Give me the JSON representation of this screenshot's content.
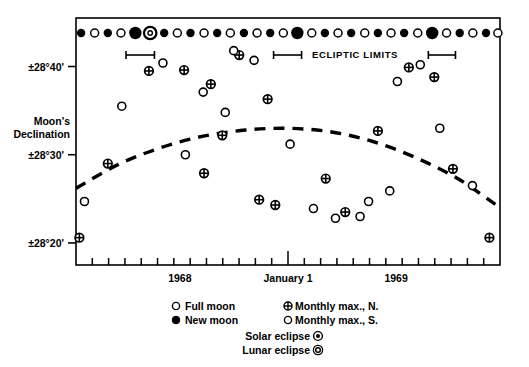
{
  "figure": {
    "background_color": "#ffffff",
    "ink_color": "#000000"
  },
  "axes": {
    "y_axis_title_line1": "Moon's",
    "y_axis_title_line2": "Declination",
    "y_ticks": [
      {
        "label": "±28°40'",
        "value": 2840
      },
      {
        "label": "±28°30'",
        "value": 2830
      },
      {
        "label": "±28°20'",
        "value": 2820
      }
    ],
    "x_tick_labels": [
      {
        "label": "1968",
        "x_fraction": 0.245
      },
      {
        "label": "January 1",
        "x_fraction": 0.5
      },
      {
        "label": "1969",
        "x_fraction": 0.755
      }
    ],
    "x_minor_tick_count": 26,
    "grid": false,
    "ylim": [
      2817.5,
      2845.5
    ],
    "xlim": [
      0,
      1
    ]
  },
  "annotations": {
    "ecliptic_limits_label": "ECLIPTIC LIMITS",
    "ecliptic_limit_brackets": [
      {
        "x_start": 0.118,
        "x_end": 0.185
      },
      {
        "x_start": 0.466,
        "x_end": 0.532
      },
      {
        "x_start": 0.831,
        "x_end": 0.895
      }
    ]
  },
  "legend": {
    "items": [
      {
        "symbol": "open-circle",
        "label": "Full moon"
      },
      {
        "symbol": "filled-circle",
        "label": "New moon"
      },
      {
        "symbol": "crossed-circle",
        "label": "Monthly max., N."
      },
      {
        "symbol": "open-circle",
        "label": "Monthly max., S."
      },
      {
        "symbol": "dot-in-circle",
        "label": "Solar eclipse"
      },
      {
        "symbol": "double-ring-circle",
        "label": "Lunar eclipse"
      }
    ],
    "solar_eclipse_label": "Solar eclipse",
    "lunar_eclipse_label": "Lunar eclipse"
  },
  "chart_data": {
    "type": "scatter",
    "title": "",
    "xlabel": "",
    "ylabel": "Moon's Declination",
    "ylim": [
      2817.5,
      2845.5
    ],
    "y_tick_values": [
      2840,
      2830,
      2820
    ],
    "y_tick_labels": [
      "±28°40'",
      "±28°30'",
      "±28°20'"
    ],
    "x_tick_labels": [
      "1968",
      "January 1",
      "1969"
    ],
    "grid": false,
    "legend_position": "below-axes",
    "series": [
      {
        "name": "Monthly max., N.",
        "symbol": "crossed-circle",
        "points": [
          {
            "x": 0.008,
            "y": 2820.6
          },
          {
            "x": 0.075,
            "y": 2829.0
          },
          {
            "x": 0.172,
            "y": 2839.5
          },
          {
            "x": 0.255,
            "y": 2839.6
          },
          {
            "x": 0.345,
            "y": 2832.2
          },
          {
            "x": 0.432,
            "y": 2824.9
          },
          {
            "x": 0.47,
            "y": 2824.3
          },
          {
            "x": 0.385,
            "y": 2841.3
          },
          {
            "x": 0.318,
            "y": 2838.0
          },
          {
            "x": 0.452,
            "y": 2836.3
          },
          {
            "x": 0.302,
            "y": 2827.9
          },
          {
            "x": 0.589,
            "y": 2827.3
          },
          {
            "x": 0.635,
            "y": 2823.5
          },
          {
            "x": 0.712,
            "y": 2832.7
          },
          {
            "x": 0.785,
            "y": 2839.9
          },
          {
            "x": 0.845,
            "y": 2838.8
          },
          {
            "x": 0.889,
            "y": 2828.4
          },
          {
            "x": 0.975,
            "y": 2820.6
          }
        ]
      },
      {
        "name": "Monthly max., S.",
        "symbol": "open-circle",
        "points": [
          {
            "x": 0.02,
            "y": 2824.7
          },
          {
            "x": 0.108,
            "y": 2835.5
          },
          {
            "x": 0.205,
            "y": 2840.4
          },
          {
            "x": 0.3,
            "y": 2837.1
          },
          {
            "x": 0.372,
            "y": 2841.8
          },
          {
            "x": 0.42,
            "y": 2840.7
          },
          {
            "x": 0.258,
            "y": 2830.0
          },
          {
            "x": 0.352,
            "y": 2834.8
          },
          {
            "x": 0.505,
            "y": 2831.2
          },
          {
            "x": 0.56,
            "y": 2823.9
          },
          {
            "x": 0.67,
            "y": 2823.0
          },
          {
            "x": 0.612,
            "y": 2822.8
          },
          {
            "x": 0.74,
            "y": 2825.9
          },
          {
            "x": 0.69,
            "y": 2824.7
          },
          {
            "x": 0.812,
            "y": 2840.2
          },
          {
            "x": 0.758,
            "y": 2838.3
          },
          {
            "x": 0.858,
            "y": 2833.0
          },
          {
            "x": 0.935,
            "y": 2826.5
          }
        ]
      }
    ],
    "moon_phase_row": {
      "y_pixel": 33,
      "phases": [
        {
          "x": 0.012,
          "type": "new"
        },
        {
          "x": 0.044,
          "type": "full"
        },
        {
          "x": 0.075,
          "type": "new"
        },
        {
          "x": 0.106,
          "type": "full"
        },
        {
          "x": 0.14,
          "type": "solar-eclipse"
        },
        {
          "x": 0.175,
          "type": "lunar-eclipse"
        },
        {
          "x": 0.208,
          "type": "new"
        },
        {
          "x": 0.239,
          "type": "full"
        },
        {
          "x": 0.27,
          "type": "new"
        },
        {
          "x": 0.302,
          "type": "full"
        },
        {
          "x": 0.333,
          "type": "new"
        },
        {
          "x": 0.364,
          "type": "full"
        },
        {
          "x": 0.396,
          "type": "new"
        },
        {
          "x": 0.427,
          "type": "full"
        },
        {
          "x": 0.458,
          "type": "new"
        },
        {
          "x": 0.489,
          "type": "full"
        },
        {
          "x": 0.522,
          "type": "solar-eclipse"
        },
        {
          "x": 0.556,
          "type": "full"
        },
        {
          "x": 0.587,
          "type": "new"
        },
        {
          "x": 0.618,
          "type": "full"
        },
        {
          "x": 0.649,
          "type": "new"
        },
        {
          "x": 0.681,
          "type": "full"
        },
        {
          "x": 0.712,
          "type": "new"
        },
        {
          "x": 0.743,
          "type": "full"
        },
        {
          "x": 0.774,
          "type": "new"
        },
        {
          "x": 0.806,
          "type": "full"
        },
        {
          "x": 0.84,
          "type": "solar-eclipse"
        },
        {
          "x": 0.874,
          "type": "full"
        },
        {
          "x": 0.905,
          "type": "new"
        },
        {
          "x": 0.936,
          "type": "full"
        },
        {
          "x": 0.967,
          "type": "new"
        },
        {
          "x": 0.995,
          "type": "full"
        }
      ]
    },
    "trend_curve": {
      "style": "dashed",
      "description": "Smooth parabolic envelope peaking near January 1",
      "points": [
        {
          "x": 0.0,
          "y": 2826.2
        },
        {
          "x": 0.1,
          "y": 2828.9
        },
        {
          "x": 0.2,
          "y": 2830.8
        },
        {
          "x": 0.3,
          "y": 2832.1
        },
        {
          "x": 0.4,
          "y": 2832.8
        },
        {
          "x": 0.5,
          "y": 2833.0
        },
        {
          "x": 0.6,
          "y": 2832.6
        },
        {
          "x": 0.7,
          "y": 2831.5
        },
        {
          "x": 0.8,
          "y": 2829.7
        },
        {
          "x": 0.9,
          "y": 2827.3
        },
        {
          "x": 1.0,
          "y": 2824.0
        }
      ]
    }
  }
}
